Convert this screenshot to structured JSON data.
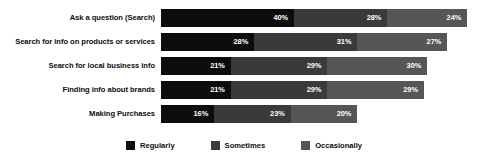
{
  "chart_data": {
    "type": "bar",
    "orientation": "horizontal",
    "stacked": true,
    "title": "",
    "subtitle": "",
    "xlabel": "",
    "ylabel": "",
    "grid": false,
    "legend_position": "bottom-center",
    "xlim": [
      0,
      100
    ],
    "value_suffix": "%",
    "categories": [
      "Ask a question (Search)",
      "Search for info on products or services",
      "Search for local business info",
      "Finding info about brands",
      "Making Purchases"
    ],
    "series": [
      {
        "name": "Regularly",
        "color": "#0d0d0d",
        "values": [
          40,
          28,
          21,
          21,
          16
        ]
      },
      {
        "name": "Sometimes",
        "color": "#3a3a3a",
        "values": [
          28,
          31,
          29,
          29,
          23
        ]
      },
      {
        "name": "Occasionally",
        "color": "#565656",
        "values": [
          24,
          27,
          30,
          29,
          20
        ]
      }
    ],
    "rows": [
      {
        "category": "Ask a question (Search)",
        "segments": [
          {
            "series": "Regularly",
            "value": 40,
            "label": "40%",
            "color": "#0d0d0d"
          },
          {
            "series": "Sometimes",
            "value": 28,
            "label": "28%",
            "color": "#3a3a3a"
          },
          {
            "series": "Occasionally",
            "value": 24,
            "label": "24%",
            "color": "#565656"
          }
        ]
      },
      {
        "category": "Search for info on products or services",
        "segments": [
          {
            "series": "Regularly",
            "value": 28,
            "label": "28%",
            "color": "#0d0d0d"
          },
          {
            "series": "Sometimes",
            "value": 31,
            "label": "31%",
            "color": "#3a3a3a"
          },
          {
            "series": "Occasionally",
            "value": 27,
            "label": "27%",
            "color": "#565656"
          }
        ]
      },
      {
        "category": "Search for local business info",
        "segments": [
          {
            "series": "Regularly",
            "value": 21,
            "label": "21%",
            "color": "#0d0d0d"
          },
          {
            "series": "Sometimes",
            "value": 29,
            "label": "29%",
            "color": "#3a3a3a"
          },
          {
            "series": "Occasionally",
            "value": 30,
            "label": "30%",
            "color": "#565656"
          }
        ]
      },
      {
        "category": "Finding info about brands",
        "segments": [
          {
            "series": "Regularly",
            "value": 21,
            "label": "21%",
            "color": "#0d0d0d"
          },
          {
            "series": "Sometimes",
            "value": 29,
            "label": "29%",
            "color": "#3a3a3a"
          },
          {
            "series": "Occasionally",
            "value": 29,
            "label": "29%",
            "color": "#565656"
          }
        ]
      },
      {
        "category": "Making Purchases",
        "segments": [
          {
            "series": "Regularly",
            "value": 16,
            "label": "16%",
            "color": "#0d0d0d"
          },
          {
            "series": "Sometimes",
            "value": 23,
            "label": "23%",
            "color": "#3a3a3a"
          },
          {
            "series": "Occasionally",
            "value": 20,
            "label": "20%",
            "color": "#565656"
          }
        ]
      }
    ],
    "legend": [
      {
        "label": "Regularly",
        "color": "#0d0d0d"
      },
      {
        "label": "Sometimes",
        "color": "#3a3a3a"
      },
      {
        "label": "Occasionally",
        "color": "#565656"
      }
    ]
  },
  "style": {
    "background": "#ffffff",
    "text_color": "#0d0d0d",
    "value_text_color": "#ffffff",
    "px_per_percent": 3.33
  }
}
